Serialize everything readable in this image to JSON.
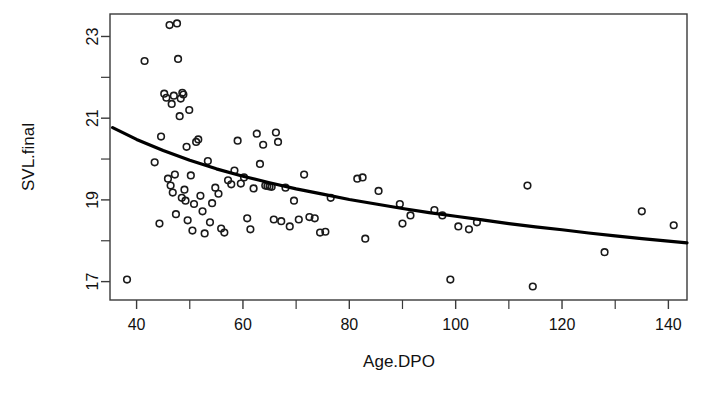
{
  "chart_data": {
    "type": "scatter",
    "title": "",
    "xlabel": "Age.DPO",
    "ylabel": "SVL.final",
    "xlim": [
      35.0,
      143.5
    ],
    "ylim": [
      16.55,
      23.55
    ],
    "xticks": [
      40,
      60,
      80,
      100,
      120,
      140
    ],
    "xtick_labels": [
      "40",
      "60",
      "80",
      "100",
      "120",
      "140"
    ],
    "x_minor_ticks": [
      50,
      70,
      90,
      110,
      130
    ],
    "yticks": [
      17,
      19,
      21,
      23
    ],
    "ytick_labels": [
      "17",
      "19",
      "21",
      "23"
    ],
    "y_minor_ticks": [
      18,
      20,
      22
    ],
    "grid": false,
    "legend": null,
    "marker": {
      "shape": "open-circle",
      "size": 6.6,
      "edge_color": "#1a1a1a",
      "fill": "none",
      "line_width": 1.6
    },
    "fit_curve": {
      "name": "fitted regression curve",
      "color": "#000000",
      "line_width": 3.2,
      "type": "decreasing-logarithmic",
      "points": [
        [
          35.5,
          20.77
        ],
        [
          40,
          20.48
        ],
        [
          45,
          20.21
        ],
        [
          50,
          19.97
        ],
        [
          55,
          19.76
        ],
        [
          60,
          19.58
        ],
        [
          65,
          19.42
        ],
        [
          70,
          19.27
        ],
        [
          75,
          19.14
        ],
        [
          80,
          19.01
        ],
        [
          85,
          18.9
        ],
        [
          90,
          18.79
        ],
        [
          95,
          18.69
        ],
        [
          100,
          18.6
        ],
        [
          105,
          18.51
        ],
        [
          110,
          18.42
        ],
        [
          115,
          18.34
        ],
        [
          120,
          18.27
        ],
        [
          125,
          18.19
        ],
        [
          130,
          18.12
        ],
        [
          135,
          18.05
        ],
        [
          140,
          17.99
        ],
        [
          143.5,
          17.95
        ]
      ]
    },
    "points": [
      [
        38.2,
        17.05
      ],
      [
        41.5,
        22.4
      ],
      [
        43.4,
        19.92
      ],
      [
        44.3,
        18.42
      ],
      [
        44.6,
        20.55
      ],
      [
        45.2,
        21.6
      ],
      [
        45.6,
        21.5
      ],
      [
        45.9,
        19.52
      ],
      [
        46.2,
        23.28
      ],
      [
        46.4,
        19.35
      ],
      [
        46.6,
        21.35
      ],
      [
        46.8,
        19.18
      ],
      [
        47.0,
        21.55
      ],
      [
        47.2,
        19.62
      ],
      [
        47.4,
        18.65
      ],
      [
        47.6,
        23.32
      ],
      [
        47.8,
        22.45
      ],
      [
        48.1,
        21.05
      ],
      [
        48.3,
        21.48
      ],
      [
        48.5,
        19.05
      ],
      [
        48.6,
        21.62
      ],
      [
        48.8,
        21.58
      ],
      [
        49.0,
        19.25
      ],
      [
        49.2,
        18.98
      ],
      [
        49.4,
        20.3
      ],
      [
        49.6,
        18.5
      ],
      [
        49.9,
        21.2
      ],
      [
        50.2,
        19.6
      ],
      [
        50.5,
        18.25
      ],
      [
        50.8,
        18.9
      ],
      [
        51.2,
        20.42
      ],
      [
        51.6,
        20.48
      ],
      [
        52.0,
        19.1
      ],
      [
        52.4,
        18.72
      ],
      [
        52.8,
        18.18
      ],
      [
        53.4,
        19.95
      ],
      [
        53.8,
        18.45
      ],
      [
        54.2,
        18.92
      ],
      [
        54.8,
        19.3
      ],
      [
        55.4,
        19.15
      ],
      [
        55.9,
        18.3
      ],
      [
        56.5,
        18.2
      ],
      [
        57.2,
        19.48
      ],
      [
        57.8,
        19.38
      ],
      [
        58.4,
        19.72
      ],
      [
        59.0,
        20.45
      ],
      [
        59.6,
        19.4
      ],
      [
        60.2,
        19.55
      ],
      [
        60.8,
        18.55
      ],
      [
        61.4,
        18.28
      ],
      [
        62.0,
        19.28
      ],
      [
        62.6,
        20.62
      ],
      [
        63.2,
        19.88
      ],
      [
        63.8,
        20.35
      ],
      [
        64.2,
        19.35
      ],
      [
        64.6,
        19.34
      ],
      [
        65.0,
        19.33
      ],
      [
        65.4,
        19.32
      ],
      [
        65.8,
        18.52
      ],
      [
        66.2,
        20.65
      ],
      [
        66.6,
        20.42
      ],
      [
        67.2,
        18.48
      ],
      [
        68.0,
        19.3
      ],
      [
        68.8,
        18.35
      ],
      [
        69.6,
        18.98
      ],
      [
        70.5,
        18.52
      ],
      [
        71.5,
        19.62
      ],
      [
        72.5,
        18.58
      ],
      [
        73.5,
        18.55
      ],
      [
        74.5,
        18.2
      ],
      [
        75.5,
        18.22
      ],
      [
        76.5,
        19.05
      ],
      [
        81.5,
        19.52
      ],
      [
        82.5,
        19.55
      ],
      [
        83.0,
        18.05
      ],
      [
        85.5,
        19.22
      ],
      [
        89.5,
        18.9
      ],
      [
        90.0,
        18.42
      ],
      [
        91.5,
        18.62
      ],
      [
        96.0,
        18.75
      ],
      [
        97.5,
        18.62
      ],
      [
        99.0,
        17.05
      ],
      [
        100.5,
        18.35
      ],
      [
        102.5,
        18.28
      ],
      [
        104.0,
        18.45
      ],
      [
        113.5,
        19.35
      ],
      [
        114.5,
        16.88
      ],
      [
        128.0,
        17.72
      ],
      [
        135.0,
        18.72
      ],
      [
        141.0,
        18.38
      ]
    ]
  },
  "plot_area": {
    "left_px": 110,
    "right_px": 687,
    "top_px": 14,
    "bottom_px": 300
  }
}
